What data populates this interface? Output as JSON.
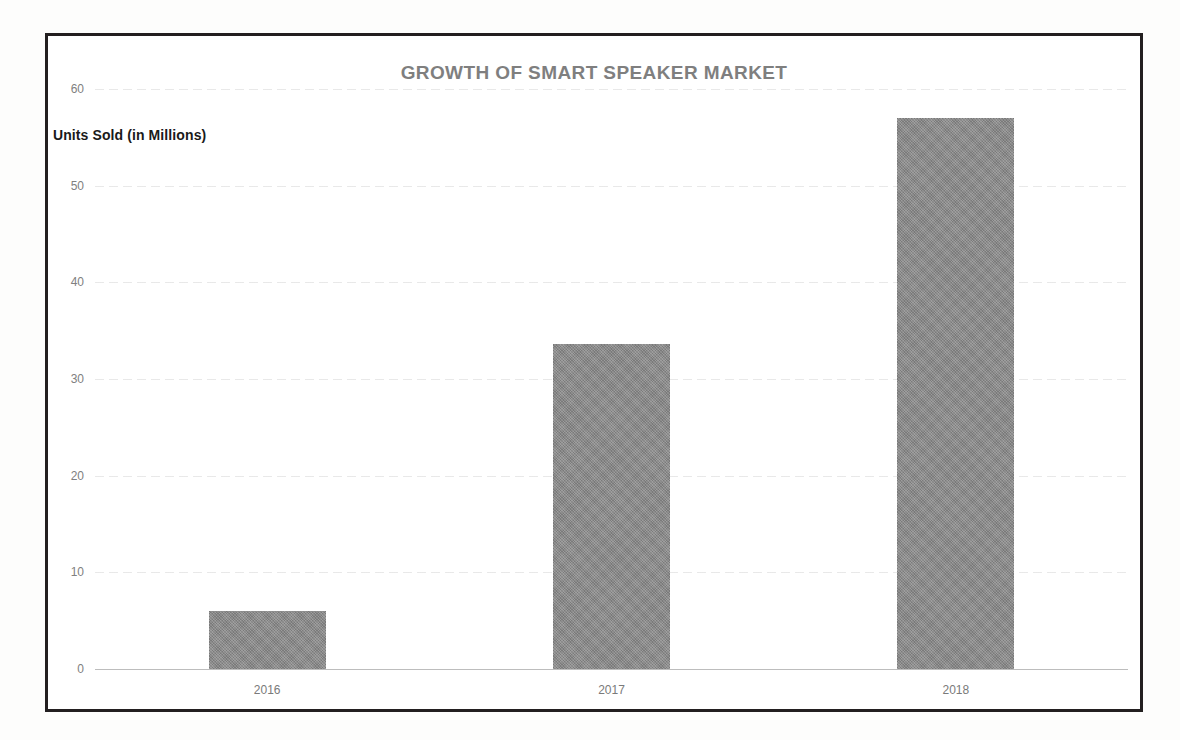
{
  "chart_data": {
    "type": "bar",
    "title": "GROWTH OF SMART SPEAKER MARKET",
    "xlabel": "",
    "ylabel": "Units Sold (in Millions)",
    "categories": [
      "2016",
      "2017",
      "2018"
    ],
    "values": [
      6,
      33.6,
      57
    ],
    "series": [
      {
        "name": "Units Sold (in Millions)",
        "values": [
          6,
          33.6,
          57
        ]
      }
    ],
    "ylim": [
      0,
      60
    ],
    "yticks": [
      0,
      10,
      20,
      30,
      40,
      50,
      60
    ],
    "ytick_labels": [
      "0",
      "10",
      "20",
      "30",
      "40",
      "50",
      "60"
    ],
    "grid": true,
    "legend": false,
    "legend_position": "none",
    "bar_color": "#8a8a8a",
    "title_color": "#7f7f7f",
    "axis_text_color": "#808080",
    "axis_label_color": "#1a1a1a",
    "gridline_color": "#e6e6e6",
    "frame_color": "#231f20",
    "background_color": "#ffffff"
  },
  "axis": {
    "y_label": "Units Sold (in Millions)"
  }
}
